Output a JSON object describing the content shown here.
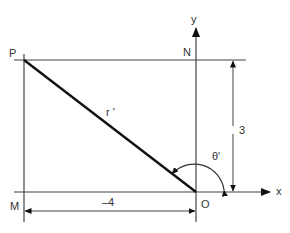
{
  "diagram": {
    "labels": {
      "P": "P",
      "N": "N",
      "y": "y",
      "x": "x",
      "M": "M",
      "O": "O",
      "r": "r '",
      "theta": "θ'",
      "dim_horizontal": "–4",
      "dim_vertical": "3"
    },
    "colors": {
      "line": "#333333",
      "thick_line": "#111111",
      "background": "#ffffff"
    }
  }
}
